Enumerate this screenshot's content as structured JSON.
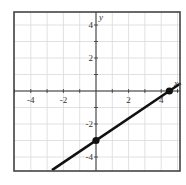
{
  "chart_data": {
    "type": "line",
    "title": "",
    "xlabel": "x",
    "ylabel": "y",
    "xlim": [
      -5,
      5.2
    ],
    "ylim": [
      -4.8,
      4.8
    ],
    "grid": true,
    "x_ticks": [
      -4,
      -2,
      2,
      4
    ],
    "y_ticks": [
      4,
      2,
      -2,
      -4
    ],
    "x_tick_labels": [
      "-4",
      "-2",
      "2",
      "4"
    ],
    "y_tick_labels": [
      "4",
      "2",
      "-2",
      "-4"
    ],
    "series": [
      {
        "name": "line",
        "equation": "y = (2/3)x - 3",
        "slope": 0.6667,
        "intercept": -3,
        "x": [
          -2.7,
          5.2
        ],
        "y": [
          -4.8,
          0.47
        ]
      }
    ],
    "points": [
      {
        "x": 0,
        "y": -3
      },
      {
        "x": 4.5,
        "y": 0
      }
    ]
  },
  "axes": {
    "x_label": "x",
    "y_label": "y"
  },
  "colors": {
    "line": "#111111",
    "grid": "#d9d9d9",
    "axis": "#333333",
    "frame": "#444444"
  }
}
